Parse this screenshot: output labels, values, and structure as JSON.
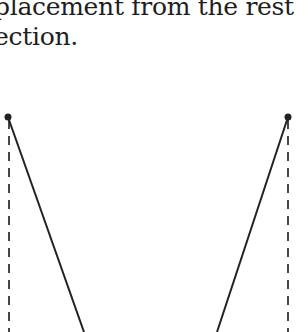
{
  "text": {
    "line1": "placement from the rest",
    "line2": "ection."
  },
  "diagram": {
    "stroke_color": "#222222",
    "left_pivot": {
      "x": 8,
      "y": 117
    },
    "right_pivot": {
      "x": 288,
      "y": 117
    },
    "left_line_end": {
      "x": 84,
      "y": 332
    },
    "right_line_end": {
      "x": 217,
      "y": 332
    },
    "dashed_line_left_x": 9,
    "dashed_line_right_x": 288
  }
}
